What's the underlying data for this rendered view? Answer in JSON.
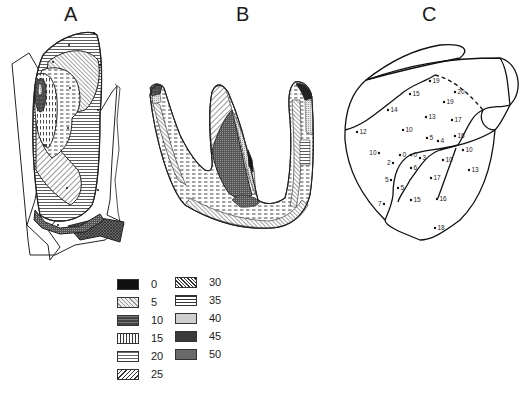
{
  "panels": {
    "a": {
      "label": "A"
    },
    "b": {
      "label": "B"
    },
    "c": {
      "label": "C",
      "points": [
        {
          "x": 430,
          "y": 81,
          "label": "19"
        },
        {
          "x": 410,
          "y": 94,
          "label": "15"
        },
        {
          "x": 455,
          "y": 92,
          "label": "20"
        },
        {
          "x": 444,
          "y": 102,
          "label": "19"
        },
        {
          "x": 388,
          "y": 110,
          "label": "14"
        },
        {
          "x": 426,
          "y": 117,
          "label": "13"
        },
        {
          "x": 452,
          "y": 120,
          "label": "17"
        },
        {
          "x": 357,
          "y": 132,
          "label": "12"
        },
        {
          "x": 403,
          "y": 130,
          "label": "10"
        },
        {
          "x": 427,
          "y": 138,
          "label": "5"
        },
        {
          "x": 438,
          "y": 141,
          "label": "4"
        },
        {
          "x": 455,
          "y": 136,
          "label": "16"
        },
        {
          "x": 379,
          "y": 153,
          "label": "10",
          "anchor": "end"
        },
        {
          "x": 400,
          "y": 155,
          "label": "0"
        },
        {
          "x": 411,
          "y": 155,
          "label": "0"
        },
        {
          "x": 420,
          "y": 158,
          "label": "3"
        },
        {
          "x": 393,
          "y": 163,
          "label": "2",
          "anchor": "end"
        },
        {
          "x": 411,
          "y": 168,
          "label": "6"
        },
        {
          "x": 443,
          "y": 160,
          "label": "10"
        },
        {
          "x": 463,
          "y": 150,
          "label": "10"
        },
        {
          "x": 469,
          "y": 170,
          "label": "13"
        },
        {
          "x": 391,
          "y": 180,
          "label": "5",
          "anchor": "end"
        },
        {
          "x": 398,
          "y": 188,
          "label": "5"
        },
        {
          "x": 431,
          "y": 178,
          "label": "17"
        },
        {
          "x": 384,
          "y": 204,
          "label": "7",
          "anchor": "end"
        },
        {
          "x": 411,
          "y": 200,
          "label": "15"
        },
        {
          "x": 437,
          "y": 199,
          "label": "16"
        },
        {
          "x": 435,
          "y": 228,
          "label": "18"
        }
      ]
    }
  },
  "legend": {
    "items": [
      {
        "value": "0",
        "pattern": "solid-black"
      },
      {
        "value": "5",
        "pattern": "light-stipple-hatch"
      },
      {
        "value": "10",
        "pattern": "dark-dashes"
      },
      {
        "value": "15",
        "pattern": "vertical-dashes"
      },
      {
        "value": "20",
        "pattern": "horizontal-dashes"
      },
      {
        "value": "25",
        "pattern": "diagonal-forward"
      },
      {
        "value": "30",
        "pattern": "diagonal-backward"
      },
      {
        "value": "35",
        "pattern": "horizontal-lines"
      },
      {
        "value": "40",
        "pattern": "fine-stipple"
      },
      {
        "value": "45",
        "pattern": "dark-stipple"
      },
      {
        "value": "50",
        "pattern": "dark-crosshatch"
      }
    ]
  }
}
